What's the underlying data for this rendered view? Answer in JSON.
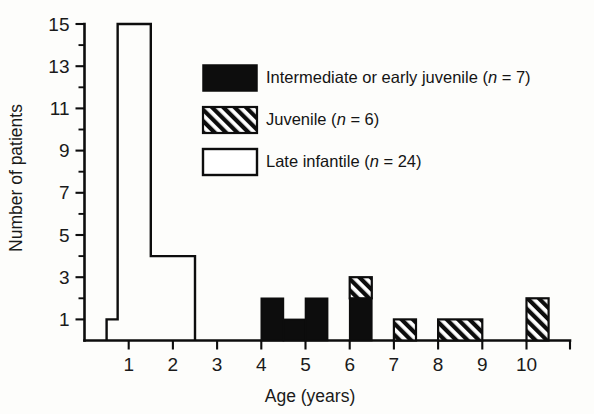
{
  "chart_data": {
    "type": "bar",
    "title": "",
    "subtitle": "",
    "xlabel": "Age (years)",
    "ylabel": "Number of patients",
    "xlim": [
      0,
      11
    ],
    "ylim": [
      0,
      15
    ],
    "grid": false,
    "legend_position": "top-right",
    "x_ticks": [
      "1",
      "2",
      "3",
      "4",
      "5",
      "6",
      "7",
      "8",
      "9",
      "10"
    ],
    "x_tick_values": [
      1,
      2,
      3,
      4,
      5,
      6,
      7,
      8,
      9,
      10
    ],
    "y_ticks": [
      "1",
      "3",
      "5",
      "7",
      "9",
      "11",
      "13",
      "15"
    ],
    "y_tick_values": [
      1,
      3,
      5,
      7,
      9,
      11,
      13,
      15
    ],
    "y_minor_tick_values": [
      2,
      4,
      6,
      8,
      10,
      12,
      14
    ],
    "bin_width": 0.5,
    "series": [
      {
        "name": "Late infantile",
        "n": 24,
        "style": "open",
        "color": "#ffffff",
        "bins": [
          {
            "x0": 0.5,
            "x1": 0.75,
            "value": 1
          },
          {
            "x0": 0.75,
            "x1": 1.5,
            "value": 15
          },
          {
            "x0": 1.5,
            "x1": 2.5,
            "value": 4
          }
        ]
      },
      {
        "name": "Intermediate or early juvenile",
        "n": 7,
        "style": "solid",
        "color": "#0d0d0d",
        "bins": [
          {
            "x0": 4.0,
            "x1": 4.5,
            "value": 2
          },
          {
            "x0": 4.5,
            "x1": 5.0,
            "value": 1
          },
          {
            "x0": 5.0,
            "x1": 5.5,
            "value": 2
          },
          {
            "x0": 6.0,
            "x1": 6.5,
            "value": 2
          }
        ]
      },
      {
        "name": "Juvenile",
        "n": 6,
        "style": "hatched",
        "color": "#0d0d0d",
        "bins": [
          {
            "x0": 6.0,
            "x1": 6.5,
            "value": 1,
            "base": 2
          },
          {
            "x0": 7.0,
            "x1": 7.5,
            "value": 1,
            "base": 0
          },
          {
            "x0": 8.0,
            "x1": 9.0,
            "value": 1,
            "base": 0
          },
          {
            "x0": 10.0,
            "x1": 10.5,
            "value": 2,
            "base": 0
          }
        ]
      }
    ]
  },
  "legend": {
    "items": [
      {
        "swatch": "solid",
        "label": "Intermediate or early juvenile",
        "n_prefix": "(",
        "n_var": "n",
        "n_eq": " = ",
        "n_value": "7",
        "n_suffix": ")"
      },
      {
        "swatch": "hatched",
        "label": "Juvenile",
        "n_prefix": "(",
        "n_var": "n",
        "n_eq": " = ",
        "n_value": "6",
        "n_suffix": ")"
      },
      {
        "swatch": "open",
        "label": "Late infantile",
        "n_prefix": "(",
        "n_var": "n",
        "n_eq": " = ",
        "n_value": "24",
        "n_suffix": ")"
      }
    ]
  },
  "axes": {
    "x_title": "Age (years)",
    "y_title": "Number of patients"
  },
  "colors": {
    "ink": "#0d0d0d",
    "paper": "#fdfdfb",
    "solid_fill": "#0d0d0d",
    "open_fill": "#ffffff"
  }
}
